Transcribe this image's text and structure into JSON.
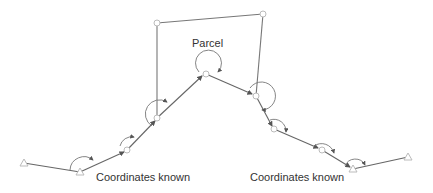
{
  "diagram": {
    "labels": {
      "parcel": "Parcel",
      "known_left": "Coordinates known",
      "known_right": "Coordinates known"
    },
    "colors": {
      "line": "#666666",
      "vertex_stroke": "#bbbbbb",
      "text": "#333333"
    },
    "traverse_points": [
      {
        "x": 24,
        "y": 163,
        "type": "known-triangle"
      },
      {
        "x": 80,
        "y": 172,
        "type": "known-triangle"
      },
      {
        "x": 127,
        "y": 150,
        "type": "station"
      },
      {
        "x": 157,
        "y": 118,
        "type": "station"
      },
      {
        "x": 206,
        "y": 74,
        "type": "station"
      },
      {
        "x": 256,
        "y": 96,
        "type": "station"
      },
      {
        "x": 274,
        "y": 129,
        "type": "station"
      },
      {
        "x": 322,
        "y": 150,
        "type": "station"
      },
      {
        "x": 353,
        "y": 169,
        "type": "known-triangle"
      },
      {
        "x": 408,
        "y": 157,
        "type": "known-triangle"
      }
    ],
    "parcel_points": [
      {
        "x": 157,
        "y": 23
      },
      {
        "x": 263,
        "y": 14
      }
    ]
  }
}
